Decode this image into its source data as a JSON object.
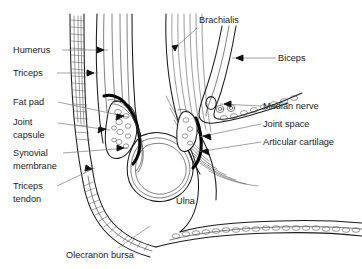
{
  "figure": {
    "background_color": "#ffffff",
    "line_color": "#1a1a1a",
    "leader_color": "#7a7a7a",
    "capsule_color": "#000000"
  },
  "labels_left": [
    {
      "id": "humerus",
      "text": "Humerus",
      "text2": "",
      "x": 13,
      "y": 53,
      "leader": "M62,50 L108,50",
      "arrow": "M104,50 l-7,-3 l0,6 z"
    },
    {
      "id": "triceps",
      "text": "Triceps",
      "text2": "",
      "x": 13,
      "y": 76,
      "leader": "M57,73 L98,73",
      "arrow": "M94,73 l-7,-3 l0,6 z"
    },
    {
      "id": "fat-pad",
      "text": "Fat pad",
      "text2": "",
      "x": 13,
      "y": 105,
      "leader": "M58,102 L128,117",
      "arrow": "M124,116 l-7,-2 l-1,6 z"
    },
    {
      "id": "joint-capsule",
      "text": "Joint",
      "text2": "capsule",
      "x": 13,
      "y": 125,
      "leader": "M58,123 L110,130",
      "arrow": "M106,129 l-7,-2 l-1,6 z"
    },
    {
      "id": "synovial-membrane",
      "text": "Synovial",
      "text2": "membrane",
      "x": 13,
      "y": 156,
      "leader": "M63,153 L128,148",
      "arrow": "M124,148 l-7,-3 l0,6 z"
    },
    {
      "id": "triceps-tendon",
      "text": "Triceps",
      "text2": "tendon",
      "x": 13,
      "y": 189,
      "leader": "M57,186 L95,168",
      "arrow": "M92,169 l-6,-4 l-1,6 z"
    }
  ],
  "labels_right": [
    {
      "id": "brachialis",
      "text": "Brachialis",
      "x": 199,
      "y": 23,
      "leader": "M197,28 L176,47",
      "arrow": "M178,45 l-6,1 l3,5 z"
    },
    {
      "id": "biceps",
      "text": "Biceps",
      "x": 278,
      "y": 61,
      "leader": "M276,58 L232,58",
      "arrow": "M236,58 l7,-3 l0,6 z"
    },
    {
      "id": "median-nerve",
      "text": "Median nerve",
      "x": 263,
      "y": 109,
      "leader": "M261,106 L220,104",
      "arrow": "M224,104 l7,-3 l0,6 z"
    },
    {
      "id": "joint-space",
      "text": "Joint space",
      "x": 263,
      "y": 127,
      "leader": "M261,124 L199,137",
      "arrow": "M203,136 l7,-2 l1,6 z"
    },
    {
      "id": "articular-cartilage",
      "text": "Articular cartilage",
      "x": 263,
      "y": 145,
      "leader": "M261,142 L197,152",
      "arrow": "M201,151 l7,-2 l1,6 z"
    }
  ],
  "labels_inline": [
    {
      "id": "ulna",
      "text": "Ulna",
      "x": 176,
      "y": 204,
      "leader": "",
      "arrow": ""
    },
    {
      "id": "olecranon-bursa",
      "text": "Olecranon bursa",
      "x": 66,
      "y": 258,
      "leader": "M118,248 L150,226",
      "arrow": ""
    }
  ],
  "internal_arrows": [
    {
      "id": "arrow-humerus-shaft",
      "at": "108,50"
    },
    {
      "id": "arrow-triceps-belly",
      "at": "98,73"
    },
    {
      "id": "arrow-fat-pad",
      "at": "128,117"
    },
    {
      "id": "arrow-joint-capsule",
      "at": "110,130"
    },
    {
      "id": "arrow-synovial",
      "at": "128,148"
    },
    {
      "id": "arrow-triceps-tendon",
      "at": "95,168"
    },
    {
      "id": "arrow-brachialis",
      "at": "176,47"
    },
    {
      "id": "arrow-biceps",
      "at": "232,58"
    },
    {
      "id": "arrow-anterior-fat-pad",
      "at": "196,120"
    },
    {
      "id": "arrow-joint-space",
      "at": "199,137"
    },
    {
      "id": "arrow-cartilage",
      "at": "197,152"
    },
    {
      "id": "arrow-bursa",
      "at": "150,226"
    }
  ],
  "structures": [
    {
      "id": "humerus-shaft",
      "name": "Humerus shaft"
    },
    {
      "id": "triceps-muscle",
      "name": "Triceps muscle belly"
    },
    {
      "id": "triceps-tendon-band",
      "name": "Triceps tendon"
    },
    {
      "id": "brachialis-muscle",
      "name": "Brachialis muscle"
    },
    {
      "id": "biceps-tendon",
      "name": "Biceps tendon"
    },
    {
      "id": "posterior-fat-pad",
      "name": "Posterior fat pad"
    },
    {
      "id": "anterior-fat-pad",
      "name": "Anterior fat pad"
    },
    {
      "id": "joint-capsule-band",
      "name": "Joint capsule"
    },
    {
      "id": "synovial-layer",
      "name": "Synovial membrane"
    },
    {
      "id": "trochlea",
      "name": "Trochlea of humerus"
    },
    {
      "id": "ulna-bone",
      "name": "Ulna"
    },
    {
      "id": "olecranon-bursa-sac",
      "name": "Olecranon bursa"
    },
    {
      "id": "median-nerve-vessels",
      "name": "Median nerve and vessels"
    }
  ]
}
